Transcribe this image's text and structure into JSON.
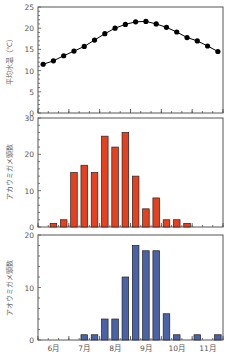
{
  "chart_data": [
    {
      "type": "line",
      "title": "",
      "xlabel": "",
      "ylabel": "平均水温（℃）",
      "ylim": [
        0,
        25
      ],
      "yticks": [
        0,
        5,
        10,
        15,
        20,
        25
      ],
      "grid": false,
      "marker": "filled-circle",
      "color": "#000000",
      "x_bins": 18,
      "values": [
        11.5,
        12.3,
        13.5,
        14.6,
        15.7,
        17.2,
        18.7,
        20.0,
        20.9,
        21.5,
        21.6,
        21.0,
        20.2,
        19.1,
        17.8,
        17.0,
        15.8,
        14.5
      ]
    },
    {
      "type": "bar",
      "title": "",
      "xlabel": "",
      "ylabel": "アカウミガメ頭数",
      "ylim": [
        0,
        30
      ],
      "yticks": [
        0,
        10,
        20,
        30
      ],
      "grid": false,
      "color": "#e8401c",
      "x_bins": 18,
      "values": [
        0,
        1,
        2,
        15,
        17,
        15,
        25,
        22,
        26,
        14,
        5,
        8,
        2,
        2,
        1,
        0,
        0,
        0
      ]
    },
    {
      "type": "bar",
      "title": "",
      "xlabel": "",
      "ylabel": "アオウミガメ頭数",
      "ylim": [
        0,
        20
      ],
      "yticks": [
        0,
        10,
        20
      ],
      "grid": false,
      "color": "#4a62a8",
      "x_bins": 18,
      "values": [
        0,
        0,
        0,
        0,
        1,
        1,
        4,
        4,
        12,
        18,
        17,
        17,
        5,
        1,
        0,
        1,
        0,
        1
      ]
    }
  ],
  "x_axis": {
    "month_labels": [
      "6月",
      "7月",
      "8月",
      "9月",
      "10月",
      "11月"
    ],
    "bins_per_month": 3
  },
  "labels": {
    "top_ylabel": "平均水温（℃）",
    "mid_ylabel": "アカウミガメ頭数",
    "bot_ylabel": "アオウミガメ頭数"
  }
}
